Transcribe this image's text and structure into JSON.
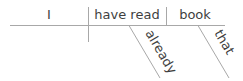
{
  "diagram": {
    "type": "sentence-diagram",
    "sentence": "I have already read that book",
    "colors": {
      "text": "#3f3f3f",
      "lines": "#a8a8a8",
      "background": "#ffffff"
    },
    "subject": {
      "label": "I"
    },
    "verb": {
      "label": "have read"
    },
    "object": {
      "label": "book"
    },
    "modifiers": [
      {
        "label": "already",
        "modifies": "have read",
        "role": "adverb"
      },
      {
        "label": "that",
        "modifies": "book",
        "role": "determiner"
      }
    ]
  }
}
